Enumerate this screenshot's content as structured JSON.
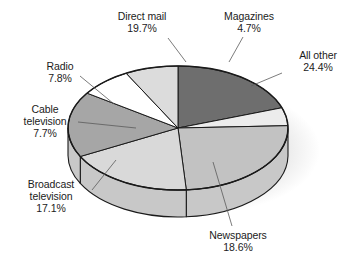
{
  "chart_data": {
    "type": "pie",
    "title": "",
    "subtitle": "",
    "xlabel": "",
    "ylabel": "",
    "legend_position": "none",
    "grid": false,
    "three_d": true,
    "value_unit": "%",
    "categories": [
      "Direct mail",
      "Magazines",
      "All other",
      "Newspapers",
      "Broadcast television",
      "Cable television",
      "Radio"
    ],
    "values": [
      19.7,
      4.7,
      24.4,
      18.6,
      17.1,
      7.7,
      7.8
    ],
    "labels": [
      "19.7%",
      "4.7%",
      "24.4%",
      "18.6%",
      "17.1%",
      "7.7%",
      "7.8%"
    ],
    "colors": [
      "#6e6e6e",
      "#ececec",
      "#c2c2c2",
      "#d9d9d9",
      "#a6a6a6",
      "#ffffff",
      "#dcdcdc"
    ],
    "slices": [
      {
        "name": "Direct mail",
        "value": 19.7,
        "label": "19.7%",
        "color": "#6e6e6e"
      },
      {
        "name": "Magazines",
        "value": 4.7,
        "label": "4.7%",
        "color": "#ececec"
      },
      {
        "name": "All other",
        "value": 24.4,
        "label": "24.4%",
        "color": "#c2c2c2"
      },
      {
        "name": "Newspapers",
        "value": 18.6,
        "label": "18.6%",
        "color": "#d9d9d9"
      },
      {
        "name": "Broadcast television",
        "value": 17.1,
        "label": "17.1%",
        "color": "#a6a6a6"
      },
      {
        "name": "Cable television",
        "value": 7.7,
        "label": "7.7%",
        "color": "#ffffff"
      },
      {
        "name": "Radio",
        "value": 7.8,
        "label": "7.8%",
        "color": "#dcdcdc"
      }
    ]
  },
  "labels": {
    "direct_mail": {
      "name": "Direct mail",
      "pct": "19.7%"
    },
    "magazines": {
      "name": "Magazines",
      "pct": "4.7%"
    },
    "all_other": {
      "name": "All other",
      "pct": "24.4%"
    },
    "newspapers": {
      "name": "Newspapers",
      "pct": "18.6%"
    },
    "broadcast_tv": {
      "name": "Broadcast",
      "name2": "television",
      "pct": "17.1%"
    },
    "cable_tv": {
      "name": "Cable",
      "name2": "television",
      "pct": "7.7%"
    },
    "radio": {
      "name": "Radio",
      "pct": "7.8%"
    }
  },
  "style": {
    "outline": "#1a1a1a",
    "side_wall": "#c8c8c8",
    "shadow": "#e3e3e3",
    "background": "#ffffff",
    "text": "#1b1b1b"
  }
}
